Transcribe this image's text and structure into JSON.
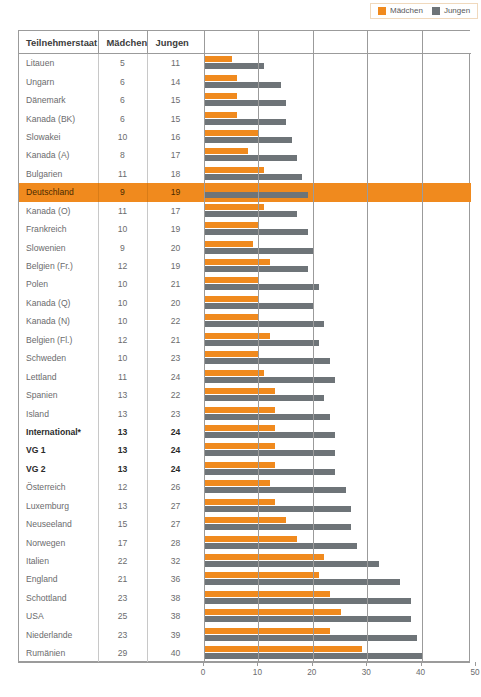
{
  "colors": {
    "maedchen": "#F08A1E",
    "jungen": "#6E7478",
    "highlight": "#F08A1E",
    "border": "#9b9b9b"
  },
  "legend": {
    "items": [
      {
        "label": "Mädchen",
        "color": "#F08A1E",
        "swatch_icon": "square-orange-icon"
      },
      {
        "label": "Jungen",
        "color": "#6E7478",
        "swatch_icon": "square-gray-icon"
      }
    ]
  },
  "table": {
    "headers": [
      "Teilnehmerstaat",
      "Mädchen",
      "Jungen",
      ""
    ]
  },
  "footnote": "",
  "chart_data": {
    "type": "bar",
    "orientation": "horizontal",
    "title": "",
    "xlabel": "",
    "ylabel": "",
    "xlim": [
      0,
      50
    ],
    "xticks": [
      0,
      10,
      20,
      30,
      40,
      50
    ],
    "grid": true,
    "legend_position": "top-right",
    "categories": [
      "Litauen",
      "Ungarn",
      "Dänemark",
      "Kanada (BK)",
      "Slowakei",
      "Kanada (A)",
      "Bulgarien",
      "Deutschland",
      "Kanada (O)",
      "Frankreich",
      "Slowenien",
      "Belgien (Fr.)",
      "Polen",
      "Kanada (Q)",
      "Kanada (N)",
      "Belgien (Fl.)",
      "Schweden",
      "Lettland",
      "Spanien",
      "Island",
      "International*",
      "VG 1",
      "VG 2",
      "Österreich",
      "Luxemburg",
      "Neuseeland",
      "Norwegen",
      "Italien",
      "England",
      "Schottland",
      "USA",
      "Niederlande",
      "Rumänien"
    ],
    "series": [
      {
        "name": "Mädchen",
        "color": "#F08A1E",
        "values": [
          5,
          6,
          6,
          6,
          10,
          8,
          11,
          9,
          11,
          10,
          9,
          12,
          10,
          10,
          10,
          12,
          10,
          11,
          13,
          13,
          13,
          13,
          13,
          12,
          13,
          15,
          17,
          22,
          21,
          23,
          25,
          23,
          29
        ]
      },
      {
        "name": "Jungen",
        "color": "#6E7478",
        "values": [
          11,
          14,
          15,
          15,
          16,
          17,
          18,
          19,
          17,
          19,
          20,
          19,
          21,
          20,
          22,
          21,
          23,
          24,
          22,
          23,
          24,
          24,
          24,
          26,
          27,
          27,
          28,
          32,
          36,
          38,
          38,
          39,
          40
        ]
      }
    ],
    "row_styles": [
      "normal",
      "normal",
      "normal",
      "normal",
      "normal",
      "normal",
      "normal",
      "highlight",
      "normal",
      "normal",
      "normal",
      "normal",
      "normal",
      "normal",
      "normal",
      "normal",
      "normal",
      "normal",
      "normal",
      "normal",
      "bold",
      "bold",
      "bold",
      "normal",
      "normal",
      "normal",
      "normal",
      "normal",
      "normal",
      "normal",
      "normal",
      "normal",
      "normal"
    ]
  }
}
